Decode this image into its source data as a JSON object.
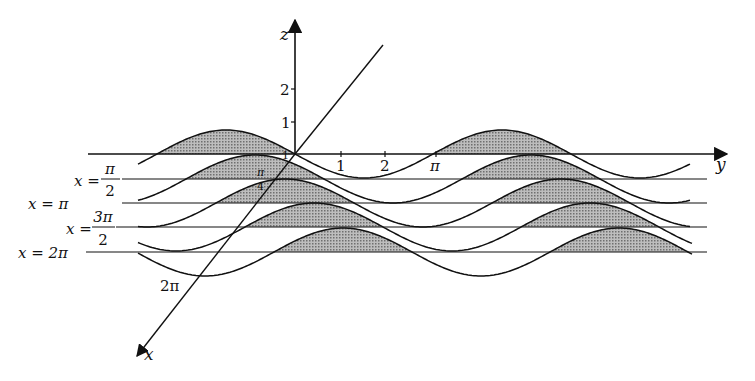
{
  "figure": {
    "axes": {
      "z_label": "z",
      "y_label": "y",
      "x_label": "x",
      "z_ticks": [
        "1",
        "2"
      ],
      "y_ticks": [
        "1",
        "2",
        "π"
      ],
      "x_ticks": [
        "2π"
      ],
      "origin_marks": [
        "1",
        "π",
        "4"
      ]
    },
    "slices": [
      {
        "label": "",
        "baseline_y": 154,
        "shift": 0
      },
      {
        "label_prefix": "x =",
        "num": "π",
        "den": "2",
        "baseline_y": 179,
        "shift": 29
      },
      {
        "label": "x = π",
        "baseline_y": 203,
        "shift": 59
      },
      {
        "label_prefix": "x =",
        "num": "3π",
        "den": "2",
        "baseline_y": 227,
        "shift": 88
      },
      {
        "label": "x = 2π",
        "baseline_y": 252,
        "shift": 117
      }
    ],
    "colors": {
      "ink": "#111111",
      "shade": "#a8a8a8",
      "background": "#ffffff"
    },
    "wave": {
      "period_px": 276,
      "amplitude_px": 24,
      "start_x": 138,
      "end_x": 690,
      "first_zero_x": 157
    }
  }
}
